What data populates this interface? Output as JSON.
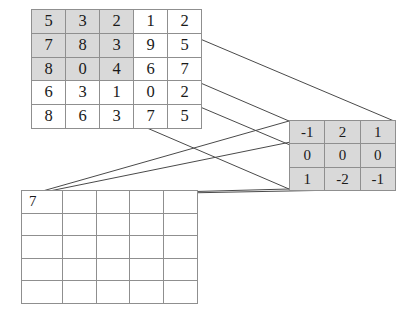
{
  "diagram": {
    "line_color": "#4a4a4a",
    "shade_color": "#d9d9d9",
    "border_color": "#8f8f8f"
  },
  "input_matrix": {
    "name": "input-feature-map",
    "rows": 5,
    "cols": 5,
    "values": [
      [
        5,
        3,
        2,
        1,
        2
      ],
      [
        7,
        8,
        3,
        9,
        5
      ],
      [
        8,
        0,
        4,
        6,
        7
      ],
      [
        6,
        3,
        1,
        0,
        2
      ],
      [
        8,
        6,
        3,
        7,
        5
      ]
    ],
    "shaded_region": {
      "row_start": 0,
      "col_start": 0,
      "rows": 3,
      "cols": 3
    }
  },
  "kernel_matrix": {
    "name": "convolution-kernel",
    "rows": 3,
    "cols": 3,
    "values": [
      [
        -1,
        2,
        1
      ],
      [
        0,
        0,
        0
      ],
      [
        1,
        -2,
        -1
      ]
    ]
  },
  "output_matrix": {
    "name": "output-feature-map",
    "rows": 5,
    "cols": 5,
    "values": [
      [
        "7",
        "",
        "",
        "",
        ""
      ],
      [
        "",
        "",
        "",
        "",
        ""
      ],
      [
        "",
        "",
        "",
        "",
        ""
      ],
      [
        "",
        "",
        "",
        "",
        ""
      ],
      [
        "",
        "",
        "",
        "",
        ""
      ]
    ]
  },
  "connector_lines": [
    {
      "name": "input-tl-to-kernel-tl",
      "x1": 33,
      "y1": 11,
      "x2": 289,
      "y2": 121
    },
    {
      "name": "input-tr-to-kernel-tr",
      "x1": 134,
      "y1": 11,
      "x2": 394,
      "y2": 121
    },
    {
      "name": "input-bl-to-kernel-bl",
      "x1": 33,
      "y1": 79,
      "x2": 289,
      "y2": 189
    },
    {
      "name": "input-br-to-kernel-br",
      "x1": 134,
      "y1": 79,
      "x2": 394,
      "y2": 189
    },
    {
      "name": "kernel-tl-to-output-cell",
      "x1": 289,
      "y1": 121,
      "x2": 25,
      "y2": 196
    },
    {
      "name": "kernel-tr-to-output-cell",
      "x1": 394,
      "y1": 121,
      "x2": 25,
      "y2": 196
    },
    {
      "name": "kernel-bl-to-output-cell",
      "x1": 289,
      "y1": 189,
      "x2": 25,
      "y2": 196
    },
    {
      "name": "kernel-br-to-output-cell",
      "x1": 394,
      "y1": 189,
      "x2": 25,
      "y2": 196
    }
  ]
}
